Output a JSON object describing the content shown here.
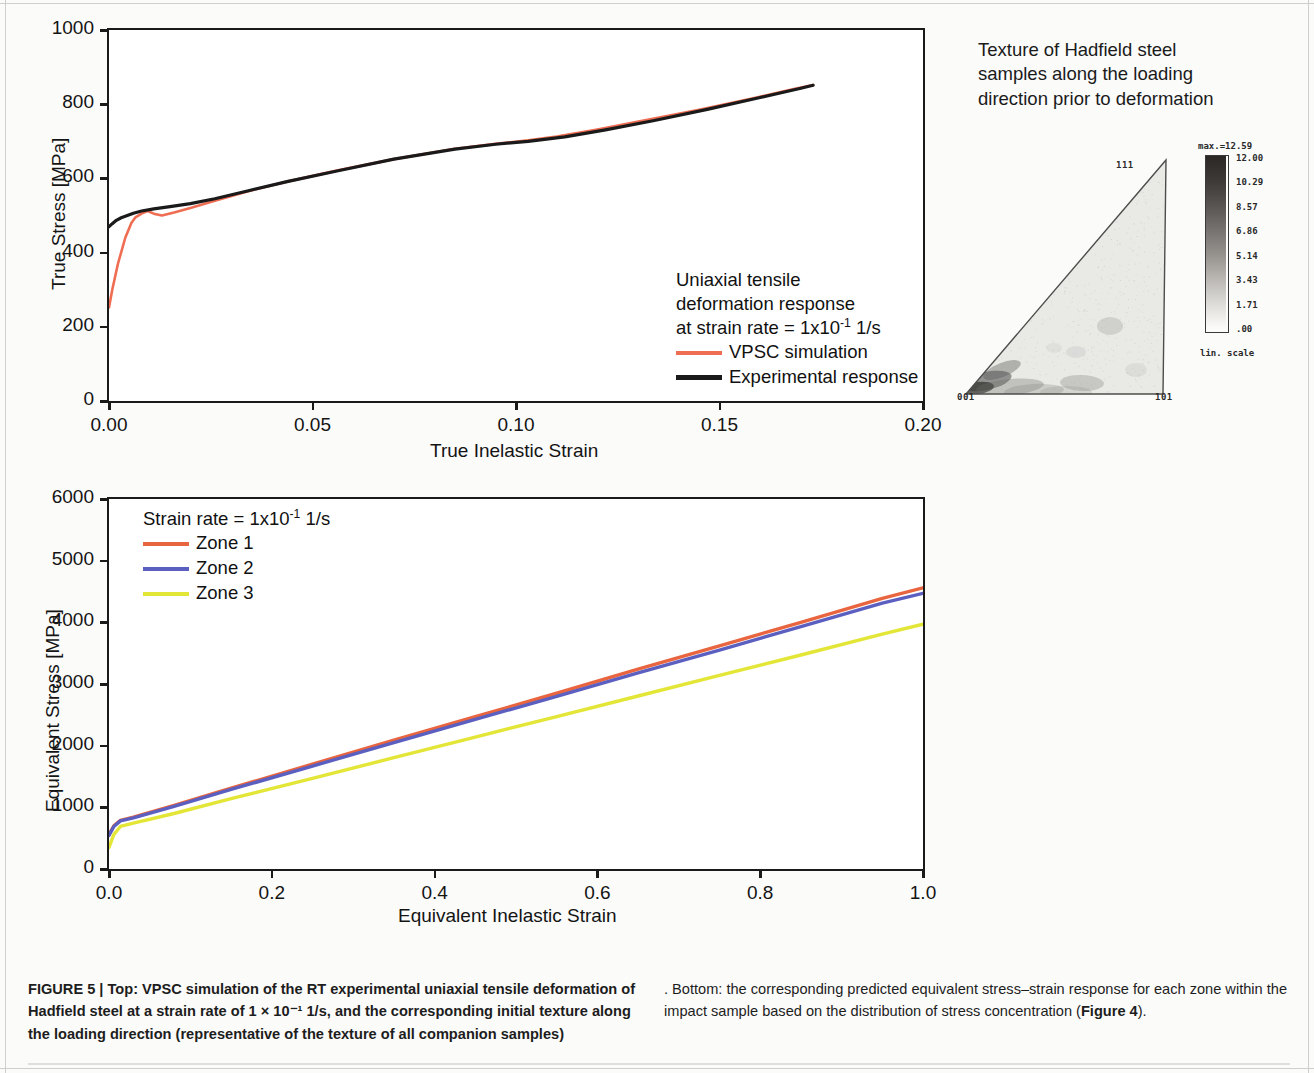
{
  "figure": {
    "label": "FIGURE 5 |",
    "caption_left_bold": "FIGURE 5 | Top: VPSC simulation of the RT experimental uniaxial tensile deformation of Hadfield steel at a strain rate of 1 × 10⁻¹ 1/s, and the corresponding initial texture along the loading direction (representative of the texture of all companion samples)",
    "caption_right_plain": ". Bottom: the corresponding predicted equivalent stress–strain response for each zone within the impact sample based on the distribution of stress concentration (",
    "caption_ref": "Figure 4",
    "caption_end": ")."
  },
  "texture": {
    "title": "Texture of Hadfield steel\nsamples along the loading\ndirection prior to deformation",
    "corner_labels": {
      "bottom_left": "001",
      "bottom_right": "101",
      "top": "111"
    },
    "scale": {
      "max_label": "max.=12.59",
      "levels": [
        "12.00",
        "10.29",
        "8.57",
        "6.86",
        "5.14",
        "3.43",
        "1.71",
        ".00"
      ],
      "scale_type": "lin. scale"
    }
  },
  "colors": {
    "vpsc_red": "#ef6d52",
    "experimental_black": "#1a1a1a",
    "zone1": "#e8653f",
    "zone2": "#5b5fc0",
    "zone3": "#e3e637"
  },
  "chart_data": [
    {
      "type": "line",
      "id": "top-chart",
      "title": "",
      "xlabel": "True Inelastic Strain",
      "ylabel": "True Stress [MPa]",
      "xlim": [
        0.0,
        0.2
      ],
      "ylim": [
        0,
        1000
      ],
      "xticks": [
        "0.00",
        "0.05",
        "0.10",
        "0.15",
        "0.20"
      ],
      "xtick_values": [
        0.0,
        0.05,
        0.1,
        0.15,
        0.2
      ],
      "yticks": [
        "0",
        "200",
        "400",
        "600",
        "800",
        "1000"
      ],
      "ytick_values": [
        0,
        200,
        400,
        600,
        800,
        1000
      ],
      "grid": false,
      "legend_position": "inside-lower-right",
      "legend_header": [
        "Uniaxial tensile",
        "deformation response",
        "at strain rate = 1x10⁻¹ 1/s"
      ],
      "legend_header_plain": "at strain rate = 1x10",
      "legend_header_exp": "-1",
      "legend_header_tail": " 1/s",
      "series": [
        {
          "name": "VPSC simulation",
          "color": "#ef6d52",
          "x": [
            0.0,
            0.0008,
            0.0022,
            0.004,
            0.0055,
            0.0065,
            0.008,
            0.0095,
            0.011,
            0.013,
            0.016,
            0.02,
            0.026,
            0.034,
            0.044,
            0.056,
            0.07,
            0.085,
            0.095,
            0.103,
            0.11,
            0.12,
            0.132,
            0.145,
            0.158,
            0.168,
            0.173
          ],
          "y": [
            252,
            300,
            370,
            440,
            480,
            495,
            505,
            512,
            505,
            500,
            508,
            520,
            540,
            565,
            592,
            621,
            652,
            680,
            693,
            703,
            713,
            732,
            757,
            785,
            815,
            840,
            852
          ]
        },
        {
          "name": "Experimental response",
          "color": "#1a1a1a",
          "x": [
            0.0,
            0.0008,
            0.0018,
            0.003,
            0.0045,
            0.006,
            0.008,
            0.011,
            0.015,
            0.02,
            0.026,
            0.034,
            0.044,
            0.056,
            0.07,
            0.085,
            0.095,
            0.103,
            0.112,
            0.122,
            0.134,
            0.147,
            0.16,
            0.17,
            0.173
          ],
          "y": [
            470,
            478,
            487,
            494,
            500,
            506,
            512,
            518,
            524,
            532,
            545,
            566,
            592,
            620,
            652,
            679,
            692,
            700,
            712,
            731,
            756,
            786,
            818,
            843,
            851
          ]
        }
      ]
    },
    {
      "type": "line",
      "id": "bottom-chart",
      "title": "",
      "xlabel": "Equivalent Inelastic Strain",
      "ylabel": "Equivalent Stress [MPa]",
      "xlim": [
        0.0,
        1.0
      ],
      "ylim": [
        0,
        6000
      ],
      "xticks": [
        "0.0",
        "0.2",
        "0.4",
        "0.6",
        "0.8",
        "1.0"
      ],
      "xtick_values": [
        0.0,
        0.2,
        0.4,
        0.6,
        0.8,
        1.0
      ],
      "yticks": [
        "0",
        "1000",
        "2000",
        "3000",
        "4000",
        "5000",
        "6000"
      ],
      "ytick_values": [
        0,
        1000,
        2000,
        3000,
        4000,
        5000,
        6000
      ],
      "grid": false,
      "legend_position": "inside-upper-left",
      "legend_header_plain": "Strain rate = 1x10",
      "legend_header_exp": "-1",
      "legend_header_tail": " 1/s",
      "series": [
        {
          "name": "Zone 1",
          "color": "#e8653f",
          "x": [
            0.0,
            0.006,
            0.014,
            0.03,
            0.08,
            0.15,
            0.25,
            0.35,
            0.45,
            0.55,
            0.65,
            0.75,
            0.85,
            0.95,
            1.0
          ],
          "y": [
            560,
            700,
            790,
            840,
            1030,
            1310,
            1700,
            2090,
            2470,
            2850,
            3240,
            3620,
            4000,
            4390,
            4560
          ]
        },
        {
          "name": "Zone 2",
          "color": "#5b5fc0",
          "x": [
            0.0,
            0.006,
            0.014,
            0.03,
            0.08,
            0.15,
            0.25,
            0.35,
            0.45,
            0.55,
            0.65,
            0.75,
            0.85,
            0.95,
            1.0
          ],
          "y": [
            545,
            690,
            780,
            830,
            1015,
            1290,
            1670,
            2050,
            2425,
            2800,
            3180,
            3550,
            3930,
            4310,
            4470
          ]
        },
        {
          "name": "Zone 3",
          "color": "#e3e637",
          "x": [
            0.0,
            0.006,
            0.014,
            0.03,
            0.08,
            0.15,
            0.25,
            0.35,
            0.45,
            0.55,
            0.65,
            0.75,
            0.85,
            0.95,
            1.0
          ],
          "y": [
            350,
            560,
            690,
            745,
            900,
            1140,
            1470,
            1805,
            2140,
            2470,
            2805,
            3140,
            3470,
            3810,
            3970
          ]
        }
      ]
    }
  ]
}
